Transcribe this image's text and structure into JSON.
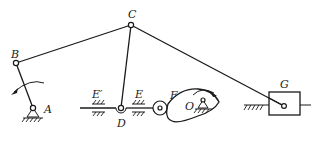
{
  "diagram": {
    "type": "planar linkage mechanism with cam and slider",
    "labels": {
      "A": "A",
      "B": "B",
      "C": "C",
      "D": "D",
      "E_prime": "E′",
      "E": "E",
      "F": "F",
      "O": "O",
      "G": "G"
    },
    "joints": {
      "A": {
        "x": 33,
        "y": 108,
        "kind": "fixed pivot"
      },
      "B": {
        "x": 16,
        "y": 63,
        "kind": "revolute"
      },
      "C": {
        "x": 131,
        "y": 25,
        "kind": "revolute"
      },
      "D": {
        "x": 121,
        "y": 108,
        "kind": "revolute on slider rod"
      },
      "F": {
        "x": 160,
        "y": 108,
        "kind": "roller follower"
      },
      "O": {
        "x": 196,
        "y": 104,
        "kind": "cam fixed pivot"
      },
      "G": {
        "x": 284,
        "y": 106,
        "kind": "slider pin"
      }
    },
    "links": [
      {
        "from": "A",
        "to": "B",
        "name": "crank AB"
      },
      {
        "from": "B",
        "to": "C",
        "name": "coupler BC"
      },
      {
        "from": "C",
        "to": "D",
        "name": "link CD"
      },
      {
        "from": "C",
        "to": "G",
        "name": "link CG"
      }
    ],
    "rotation_arrows": [
      {
        "at": "A",
        "direction": "counter-clockwise"
      },
      {
        "at": "O",
        "direction": "clockwise"
      }
    ]
  }
}
